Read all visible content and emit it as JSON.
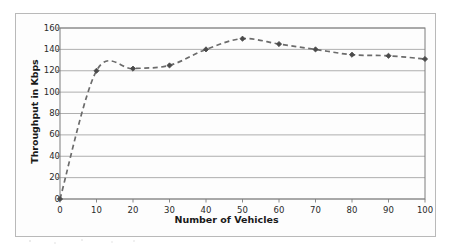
{
  "chart_data": {
    "type": "line",
    "title": "",
    "subtitle": "",
    "xlabel": "Number of Vehicles",
    "ylabel": "Throughput in Kbps",
    "x": [
      0,
      10,
      20,
      30,
      40,
      50,
      60,
      70,
      80,
      90,
      100
    ],
    "values": [
      0,
      120,
      122,
      125,
      140,
      150,
      145,
      140,
      135,
      134,
      131
    ],
    "series": [
      {
        "name": "Throughput",
        "values": [
          0,
          120,
          122,
          125,
          140,
          150,
          145,
          140,
          135,
          134,
          131
        ]
      }
    ],
    "xlim": [
      0,
      100
    ],
    "ylim": [
      0,
      160
    ],
    "xticks": [
      "0",
      "10",
      "20",
      "30",
      "40",
      "50",
      "60",
      "70",
      "80",
      "90",
      "100"
    ],
    "yticks": [
      "0",
      "20",
      "40",
      "60",
      "80",
      "100",
      "120",
      "140",
      "160"
    ],
    "xtick_values": [
      0,
      10,
      20,
      30,
      40,
      50,
      60,
      70,
      80,
      90,
      100
    ],
    "ytick_values": [
      0,
      20,
      40,
      60,
      80,
      100,
      120,
      140,
      160
    ],
    "grid": "horizontal",
    "legend": "none",
    "line_style": "dashed",
    "marker": "diamond",
    "annotations": [],
    "colors": {
      "line": "#6b6b6b",
      "marker": "#4a4a4a",
      "grid": "#9a9a9a",
      "axis": "#7d7d7d",
      "text": "#1a1a1a",
      "frame": "#b9b9b9",
      "background": "#fdfdfd"
    }
  }
}
